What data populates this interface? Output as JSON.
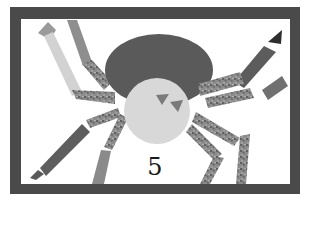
{
  "illustration": {
    "subject": "spider",
    "style": "cut-paper collage, grayscale",
    "number_label": "5",
    "colors": {
      "frame": "#4a4a4a",
      "background": "#ffffff",
      "spider_body": "#5a5a5a",
      "spider_head": "#d8d8d8",
      "speckled_leg": "#8a8a8a",
      "dark_leg": "#606060",
      "light_leg": "#d0d0d0",
      "mid_leg": "#9a9a9a",
      "eyes": "#7a7a7a"
    }
  }
}
